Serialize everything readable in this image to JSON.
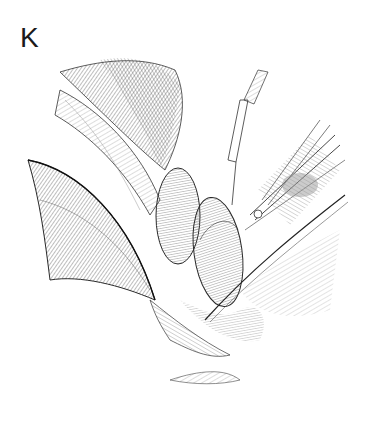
{
  "figure": {
    "panel_label": "K",
    "colors": {
      "background": "#ffffff",
      "ink": "#2a2a2a",
      "hatch": "#555555",
      "shade": "#8a8a8a"
    }
  }
}
